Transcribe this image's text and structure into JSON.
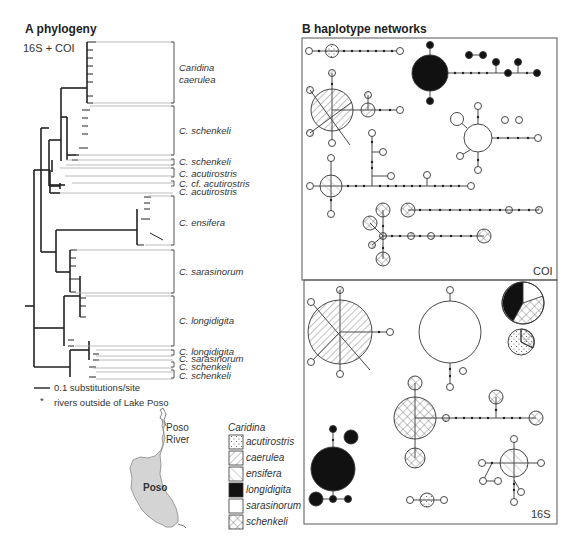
{
  "panel_a": {
    "title": "A phylogeny",
    "subtitle": "16S + COI",
    "clades": [
      {
        "label_line1": "Caridina",
        "label_line2": "caerulea"
      },
      {
        "label": "C. schenkeli"
      },
      {
        "label": "C. schenkeli"
      },
      {
        "label": "C. acutirostris"
      },
      {
        "label": "C. cf. acutirostris"
      },
      {
        "label": "C. acutirostris"
      },
      {
        "label": "C. ensifera"
      },
      {
        "label": "C. sarasinorum"
      },
      {
        "label": "C. longidigita"
      },
      {
        "label": "C. longidigita"
      },
      {
        "label": "C. sarasinorum"
      },
      {
        "label": "C. schenkeli"
      },
      {
        "label": "C. schenkeli"
      }
    ],
    "scale_bar_label": "0.1 substitutions/site",
    "asterisk_note": "rivers outside of Lake Poso",
    "asterisk_symbol": "*"
  },
  "map": {
    "lake_label": "Poso",
    "river_label_line1": "Poso",
    "river_label_line2": "River",
    "lake_color": "#d4d4d4"
  },
  "legend": {
    "title": "Caridina",
    "items": [
      {
        "pattern": "dots",
        "label": "acutirostris"
      },
      {
        "pattern": "diag-dense",
        "label": "caerulea"
      },
      {
        "pattern": "diag-sparse",
        "label": "ensifera"
      },
      {
        "pattern": "solid-black",
        "label": "longidigita"
      },
      {
        "pattern": "white",
        "label": "sarasinorum"
      },
      {
        "pattern": "crosshatch",
        "label": "schenkeli"
      }
    ]
  },
  "panel_b": {
    "title": "B haplotype networks",
    "networks": [
      {
        "label": "COI"
      },
      {
        "label": "16S"
      }
    ]
  }
}
